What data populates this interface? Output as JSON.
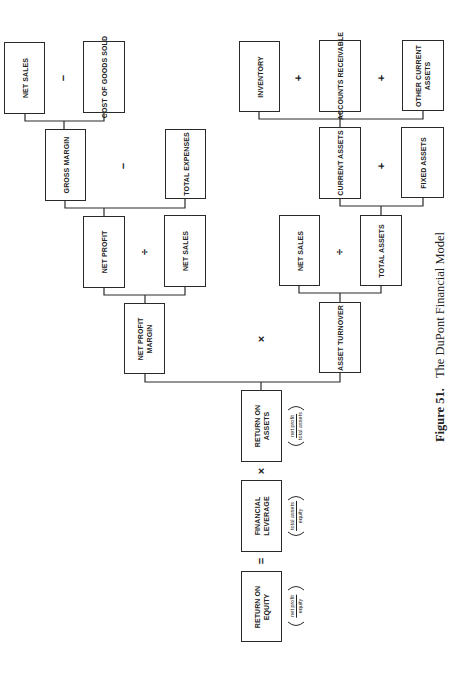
{
  "diagram": {
    "title": "The DuPont Financial Model",
    "caption": {
      "figure_label": "Figure 51.",
      "text": "The DuPont Financial Model"
    },
    "nodes": {
      "net_sales_1": "NET SALES",
      "cost_of_goods_sold": "COST OF GOODS SOLD",
      "gross_margin": "GROSS MARGIN",
      "total_expenses": "TOTAL EXPENSES",
      "net_profit": "NET PROFIT",
      "net_sales_2": "NET SALES",
      "net_profit_margin": "NET PROFIT\nMARGIN",
      "inventory": "INVENTORY",
      "accounts_receivable": "ACCOUNTS RECEIVABLE",
      "other_current_assets": "OTHER CURRENT\nASSETS",
      "current_assets": "CURRENT ASSETS",
      "fixed_assets": "FIXED ASSETS",
      "net_sales_3": "NET SALES",
      "total_assets": "TOTAL ASSETS",
      "asset_turnover": "ASSET TURNOVER",
      "return_on_assets": "RETURN ON\nASSETS",
      "financial_leverage": "FINANCIAL\nLEVERAGE",
      "return_on_equity": "RETURN ON\nEQUITY"
    },
    "operators": {
      "sales_minus_cogs": "−",
      "gm_minus_expenses": "−",
      "profit_div_sales": "÷",
      "inv_plus_ar": "+",
      "ar_plus_other": "+",
      "ca_plus_fa": "+",
      "sales_div_assets": "÷",
      "margin_times_turnover": "×",
      "roa_times_leverage": "×",
      "leverage_equals_roe": "="
    },
    "formulas": {
      "roa": {
        "numerator": "net profit",
        "denominator": "total assets"
      },
      "leverage": {
        "numerator": "total assets",
        "denominator": "equity"
      },
      "roe": {
        "numerator": "net profit",
        "denominator": "equity"
      }
    },
    "relations": [
      "GROSS MARGIN = NET SALES − COST OF GOODS SOLD",
      "NET PROFIT = GROSS MARGIN − TOTAL EXPENSES",
      "NET PROFIT MARGIN = NET PROFIT ÷ NET SALES",
      "CURRENT ASSETS = INVENTORY + ACCOUNTS RECEIVABLE + OTHER CURRENT ASSETS",
      "TOTAL ASSETS = CURRENT ASSETS + FIXED ASSETS",
      "ASSET TURNOVER = NET SALES ÷ TOTAL ASSETS",
      "RETURN ON ASSETS = NET PROFIT MARGIN × ASSET TURNOVER",
      "RETURN ON EQUITY = RETURN ON ASSETS × FINANCIAL LEVERAGE"
    ]
  }
}
